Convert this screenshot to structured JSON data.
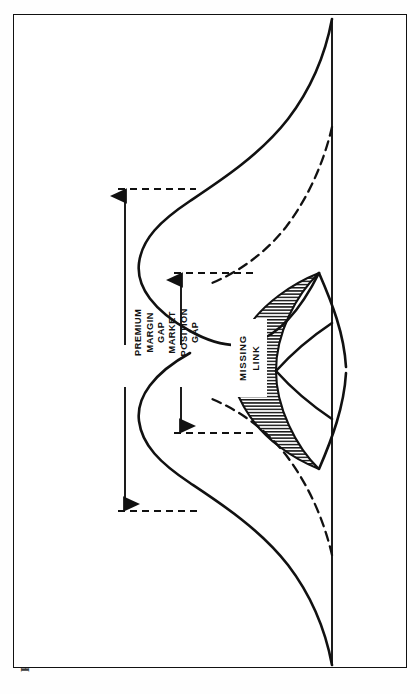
{
  "page": {
    "caption_label": "Figure 27.",
    "caption_text": "Missing a curve.",
    "orientation": "rotated-90-left",
    "background_color": "#fefefe"
  },
  "figure": {
    "frame": {
      "border_color": "#111111",
      "fill_color": "#ffffff"
    },
    "axis": {
      "name": "vertical-baseline-axis",
      "color": "#111111"
    },
    "labels": {
      "premium_margin_gap": "PREMIUM\nMARGIN\nGAP",
      "market_position_gap": "MARKET\nPOSITION\nGAP",
      "missing_link": "MISSING\nLINK"
    },
    "colors": {
      "ink": "#111111",
      "hatch": "#1a1a1a",
      "paper": "#ffffff",
      "dashed": "#111111"
    },
    "curves": [
      {
        "name": "upper-solid-lobe",
        "style": "solid"
      },
      {
        "name": "lower-solid-lobe",
        "style": "solid"
      },
      {
        "name": "upper-dashed-lobe",
        "style": "dashed"
      },
      {
        "name": "lower-dashed-lobe",
        "style": "dashed"
      },
      {
        "name": "gap-lens-upper-edge",
        "style": "solid"
      },
      {
        "name": "gap-lens-lower-edge",
        "style": "solid"
      },
      {
        "name": "crossing-tail-upper",
        "style": "solid"
      },
      {
        "name": "crossing-tail-lower",
        "style": "solid"
      }
    ],
    "dimension_arrows": [
      {
        "name": "premium-margin-gap-arrow",
        "direction": "double",
        "top": 188,
        "bottom": 510
      },
      {
        "name": "market-position-gap-arrow",
        "direction": "double",
        "top": 272,
        "bottom": 432
      }
    ],
    "guide_lines": [
      {
        "name": "guide-dash-premium-top",
        "y": 188
      },
      {
        "name": "guide-dash-market-top",
        "y": 272
      },
      {
        "name": "guide-dash-market-bottom",
        "y": 432
      },
      {
        "name": "guide-dash-premium-bottom",
        "y": 510
      }
    ],
    "hatch_region": {
      "name": "missing-link-hatched-lens",
      "pattern": "horizontal-lines",
      "spacing_px": 3.2
    }
  }
}
